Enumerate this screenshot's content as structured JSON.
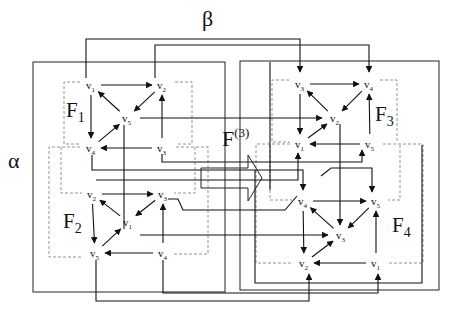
{
  "diagram": {
    "title_labels": {
      "beta": "β",
      "alpha": "α",
      "operator": "F",
      "operator_superscript": "(3)"
    },
    "faces": [
      {
        "id": "F1",
        "label": "F",
        "sub": "1",
        "nodes": [
          {
            "id": "v1",
            "label": "v",
            "sub": "1",
            "x": 91,
            "y": 85
          },
          {
            "id": "v2",
            "label": "v",
            "sub": "2",
            "x": 162,
            "y": 85
          },
          {
            "id": "v5",
            "label": "v",
            "sub": "5",
            "x": 127,
            "y": 118
          },
          {
            "id": "v4",
            "label": "v",
            "sub": "4",
            "x": 91,
            "y": 148
          },
          {
            "id": "v3",
            "label": "v",
            "sub": "3",
            "x": 162,
            "y": 148
          }
        ],
        "edges": [
          [
            "v1",
            "v2"
          ],
          [
            "v2",
            "v5"
          ],
          [
            "v5",
            "v1"
          ],
          [
            "v1",
            "v4"
          ],
          [
            "v4",
            "v5"
          ],
          [
            "v3",
            "v2"
          ],
          [
            "v3",
            "v4"
          ]
        ]
      },
      {
        "id": "F2",
        "label": "F",
        "sub": "2",
        "nodes": [
          {
            "id": "v2",
            "label": "v",
            "sub": "2",
            "x": 92,
            "y": 194
          },
          {
            "id": "v3",
            "label": "v",
            "sub": "3",
            "x": 163,
            "y": 194
          },
          {
            "id": "v1",
            "label": "v",
            "sub": "1",
            "x": 128,
            "y": 222
          },
          {
            "id": "v5",
            "label": "v",
            "sub": "5",
            "x": 95,
            "y": 253
          },
          {
            "id": "v4",
            "label": "v",
            "sub": "4",
            "x": 163,
            "y": 253
          }
        ],
        "edges": [
          [
            "v2",
            "v3"
          ],
          [
            "v3",
            "v1"
          ],
          [
            "v1",
            "v2"
          ],
          [
            "v2",
            "v5"
          ],
          [
            "v5",
            "v1"
          ],
          [
            "v4",
            "v3"
          ],
          [
            "v4",
            "v5"
          ]
        ]
      },
      {
        "id": "F3",
        "label": "F",
        "sub": "3",
        "nodes": [
          {
            "id": "v3",
            "label": "v",
            "sub": "3",
            "x": 300,
            "y": 84
          },
          {
            "id": "v4",
            "label": "v",
            "sub": "4",
            "x": 369,
            "y": 84
          },
          {
            "id": "v2",
            "label": "v",
            "sub": "2",
            "x": 335,
            "y": 118
          },
          {
            "id": "v1",
            "label": "v",
            "sub": "1",
            "x": 300,
            "y": 144
          },
          {
            "id": "v5",
            "label": "v",
            "sub": "5",
            "x": 370,
            "y": 144
          }
        ],
        "edges": [
          [
            "v3",
            "v4"
          ],
          [
            "v4",
            "v2"
          ],
          [
            "v2",
            "v3"
          ],
          [
            "v3",
            "v1"
          ],
          [
            "v1",
            "v2"
          ],
          [
            "v5",
            "v4"
          ],
          [
            "v5",
            "v1"
          ]
        ]
      },
      {
        "id": "F4",
        "label": "F",
        "sub": "4",
        "nodes": [
          {
            "id": "v4",
            "label": "v",
            "sub": "4",
            "x": 303,
            "y": 201
          },
          {
            "id": "v5",
            "label": "v",
            "sub": "5",
            "x": 376,
            "y": 201
          },
          {
            "id": "v3",
            "label": "v",
            "sub": "3",
            "x": 341,
            "y": 235
          },
          {
            "id": "v2",
            "label": "v",
            "sub": "2",
            "x": 304,
            "y": 263
          },
          {
            "id": "v1",
            "label": "v",
            "sub": "1",
            "x": 376,
            "y": 263
          }
        ],
        "edges": [
          [
            "v4",
            "v5"
          ],
          [
            "v5",
            "v3"
          ],
          [
            "v3",
            "v4"
          ],
          [
            "v4",
            "v2"
          ],
          [
            "v2",
            "v3"
          ],
          [
            "v1",
            "v5"
          ],
          [
            "v1",
            "v2"
          ]
        ]
      }
    ],
    "colors": {
      "line": "#222222",
      "dashed": "#777777",
      "background": "#ffffff"
    }
  }
}
